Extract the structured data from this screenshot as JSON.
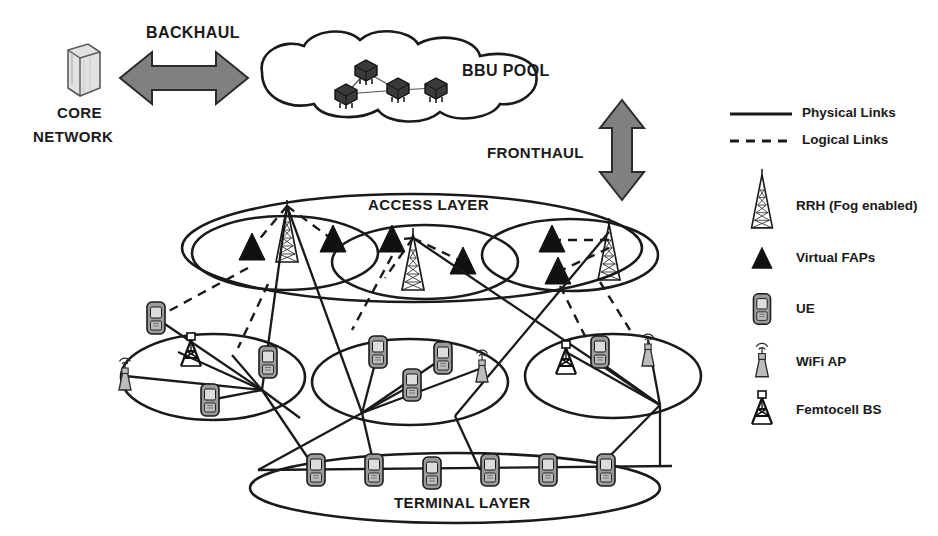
{
  "diagram": {
    "title_labels": {
      "core_network": "CORE\nNETWORK",
      "core_network_line1": "CORE",
      "core_network_line2": "NETWORK",
      "backhaul": "BACKHAUL",
      "bbu_pool": "BBU POOL",
      "fronthaul": "FRONTHAUL",
      "access_layer": "ACCESS LAYER",
      "terminal_layer": "TERMINAL LAYER"
    },
    "legend": {
      "items": [
        {
          "label": "Physical Links",
          "icon": "solid-line-icon",
          "style": "solid"
        },
        {
          "label": "Logical Links",
          "icon": "dashed-line-icon",
          "style": "dashed"
        },
        {
          "label": "RRH (Fog enabled)",
          "icon": "rrh-tower-icon",
          "style": "symbol"
        },
        {
          "label": "Virtual FAPs",
          "icon": "triangle-icon",
          "style": "symbol"
        },
        {
          "label": "UE",
          "icon": "mobile-phone-icon",
          "style": "symbol"
        },
        {
          "label": "WiFi AP",
          "icon": "wifi-ap-icon",
          "style": "symbol"
        },
        {
          "label": "Femtocell BS",
          "icon": "femtocell-bs-icon",
          "style": "symbol"
        }
      ]
    },
    "colors": {
      "ink": "#1a1a1a",
      "arrow_fill": "#808080",
      "arrow_stroke": "#2b2b2b",
      "wifi_fill": "#b9b9b9",
      "ue_fill": "#9a9a9a",
      "ue_screen": "#d8d8d8",
      "core_fill": "#d4d4d4",
      "bbu_fill": "#3a3a3a"
    },
    "bbu_pool": {
      "node_count": 4,
      "node_icon": "bbu-server-icon"
    },
    "access_layer": {
      "cell_count": 3,
      "cells": [
        {
          "name": "access-cell-1",
          "rrh_count": 1,
          "fap_count": 2
        },
        {
          "name": "access-cell-2",
          "rrh_count": 1,
          "fap_count": 2
        },
        {
          "name": "access-cell-3",
          "rrh_count": 1,
          "fap_count": 2
        }
      ]
    },
    "fog_layer": {
      "cluster_count": 3,
      "clusters": [
        {
          "name": "fog-cluster-1",
          "ue_count": 3,
          "wifi_ap_count": 1,
          "femtocell_count": 1
        },
        {
          "name": "fog-cluster-2",
          "ue_count": 3,
          "wifi_ap_count": 1,
          "femtocell_count": 0
        },
        {
          "name": "fog-cluster-3",
          "ue_count": 1,
          "wifi_ap_count": 1,
          "femtocell_count": 1
        }
      ]
    },
    "terminal_layer": {
      "ue_count": 6
    }
  }
}
